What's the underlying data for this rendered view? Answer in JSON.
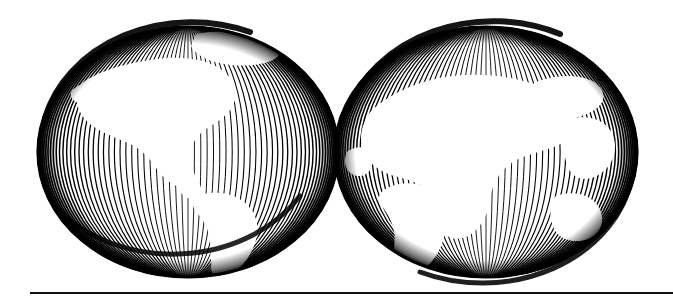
{
  "figure": {
    "name": "two-hemispheres-engraving",
    "alt_title": "Two overlapping globes in engraved meridian-hatch style",
    "background_color": "#ffffff",
    "ink_color": "#000000",
    "line_color": "#111111",
    "canvas": {
      "width": 673,
      "height": 303
    }
  },
  "globes": [
    {
      "id": "western-hemisphere",
      "label": "Western Hemisphere",
      "center_x": 188,
      "center_y": 152,
      "radius_x": 151,
      "radius_y": 126,
      "rim_thickness": 5,
      "meridian_count": 74,
      "hemisphere_shown": "Americas",
      "landmasses": [
        "North America",
        "Greenland",
        "South America",
        "Central America"
      ]
    },
    {
      "id": "eastern-hemisphere",
      "label": "Eastern Hemisphere",
      "center_x": 486,
      "center_y": 152,
      "radius_x": 152,
      "radius_y": 126,
      "rim_thickness": 5,
      "meridian_count": 74,
      "hemisphere_shown": "Europe, Africa and Asia",
      "landmasses": [
        "Europe",
        "Africa",
        "Asia",
        "Australia"
      ]
    }
  ],
  "overlap": {
    "present": true,
    "style": "crosshatch",
    "x_start": 335,
    "x_end": 339
  },
  "rule": {
    "visible": true,
    "x": 30,
    "y": 292,
    "width": 643,
    "thickness": 2,
    "color": "#111111"
  },
  "chart_data": {
    "type": "scatter",
    "xlabel": "",
    "ylabel": "",
    "categories": [
      "Western Hemisphere",
      "Eastern Hemisphere"
    ],
    "values": [
      1,
      1
    ],
    "grid": false,
    "legend": "none",
    "annotations": [
      "Americas",
      "Europe, Africa and Asia"
    ]
  }
}
